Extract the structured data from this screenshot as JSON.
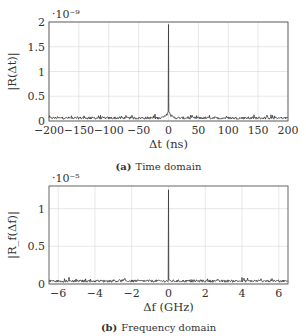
{
  "chart_data": [
    {
      "type": "line",
      "panel": "a",
      "caption_label": "(a)",
      "caption_text": "Time domain",
      "xlabel": "Δt (ns)",
      "ylabel": "|R(Δt)|",
      "exponent": "·10⁻⁹",
      "xlim": [
        -200,
        200
      ],
      "ylim": [
        0,
        2
      ],
      "xticks": [
        -200,
        -150,
        -100,
        -50,
        0,
        50,
        100,
        150,
        200
      ],
      "xtick_labels": [
        "−200",
        "−150",
        "−100",
        "−50",
        "0",
        "50",
        "100",
        "150",
        "200"
      ],
      "yticks": [
        0,
        0.5,
        1,
        1.5,
        2
      ],
      "ytick_labels": [
        "0",
        "0.5",
        "1",
        "1.5",
        "2"
      ],
      "grid": true,
      "series": [
        {
          "name": "|R(Δt)|",
          "description": "Noise floor ~0.03–0.08 (×1e-9) across range with a sharp peak of ~1.95 (×1e-9) at Δt = 0 and small shoulders (~0.15) near 0",
          "x": [
            -200,
            -150,
            -100,
            -50,
            -10,
            -5,
            -2,
            0,
            2,
            5,
            10,
            50,
            100,
            150,
            200
          ],
          "y": [
            0.05,
            0.05,
            0.05,
            0.05,
            0.06,
            0.12,
            0.2,
            1.95,
            0.2,
            0.12,
            0.06,
            0.05,
            0.05,
            0.05,
            0.05
          ]
        }
      ]
    },
    {
      "type": "line",
      "panel": "b",
      "caption_label": "(b)",
      "caption_text": "Frequency domain",
      "xlabel": "Δf (GHz)",
      "ylabel": "|R_f(Δf)|",
      "exponent": "·10⁻⁵",
      "xlim": [
        -6.5,
        6.5
      ],
      "ylim": [
        0,
        1.3
      ],
      "xticks": [
        -6,
        -4,
        -2,
        0,
        2,
        4,
        6
      ],
      "xtick_labels": [
        "−6",
        "−4",
        "−2",
        "0",
        "2",
        "4",
        "6"
      ],
      "yticks": [
        0,
        0.5,
        1
      ],
      "ytick_labels": [
        "0",
        "0.5",
        "1"
      ],
      "grid": true,
      "series": [
        {
          "name": "|R_f(Δf)|",
          "description": "Noise floor ~0.03–0.08 (×1e-5) with a single sharp spike of ~1.25 (×1e-5) at Δf = 0",
          "x": [
            -6.5,
            -6,
            -4,
            -2,
            -0.05,
            0,
            0.05,
            2,
            4,
            6,
            6.5
          ],
          "y": [
            0.05,
            0.06,
            0.05,
            0.05,
            0.06,
            1.25,
            0.06,
            0.05,
            0.05,
            0.05,
            0.05
          ]
        }
      ]
    }
  ]
}
